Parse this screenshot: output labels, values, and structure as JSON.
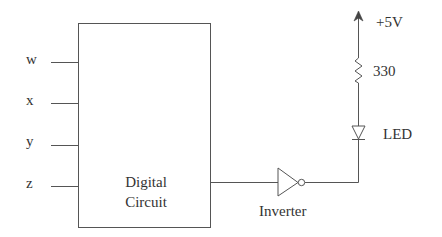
{
  "diagram": {
    "block": {
      "label_line1": "Digital",
      "label_line2": "Circuit"
    },
    "inputs": [
      {
        "label": "w"
      },
      {
        "label": "x"
      },
      {
        "label": "y"
      },
      {
        "label": "z"
      }
    ],
    "inverter": {
      "label": "Inverter"
    },
    "supply": {
      "label": "+5V"
    },
    "resistor": {
      "label": "330"
    },
    "led": {
      "label": "LED"
    }
  }
}
